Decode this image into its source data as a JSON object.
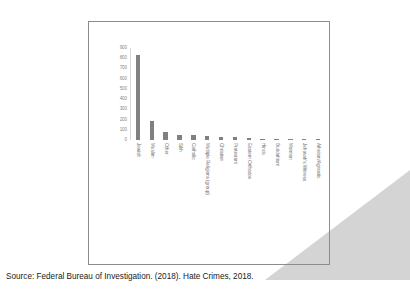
{
  "slide": {
    "source_caption": "Source: Federal Bureau of Investigation. (2018). Hate Crimes, 2018.",
    "colors": {
      "bar": "#808080",
      "frame_border": "#8c8c8c",
      "axis_text": "#8a8a8a",
      "label_text": "#737373",
      "corner_triangle": "#d4d4d4",
      "background": "#ffffff"
    }
  },
  "chart_data": {
    "type": "bar",
    "title": "",
    "subtitle": "",
    "xlabel": "",
    "ylabel": "",
    "ylim": [
      0,
      900
    ],
    "yticks": [
      900,
      800,
      700,
      600,
      500,
      400,
      300,
      200,
      100,
      0
    ],
    "grid": false,
    "legend": false,
    "orientation": "vertical",
    "categories": [
      "Jewish",
      "Muslim",
      "Other",
      "Sikh",
      "Catholic",
      "Multiple Religions (group)",
      "Christian",
      "Protestant",
      "Eastern Orthodox",
      "Hindu",
      "Buddahism",
      "Mormon",
      "Jehovah's Witness",
      "Atheism/Agnostic"
    ],
    "values": [
      835,
      188,
      80,
      49,
      47,
      42,
      31,
      25,
      20,
      11,
      9,
      6,
      4,
      3
    ]
  }
}
